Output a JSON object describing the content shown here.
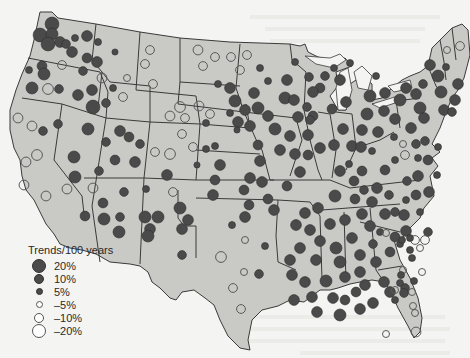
{
  "figure": {
    "type": "proportional-symbol map",
    "region": "Contiguous United States",
    "colors": {
      "page_background": "#f4f4f2",
      "land_fill": "#c9c9c6",
      "state_border": "#3a3a3a",
      "positive_fill": "#4a4a4a",
      "negative_stroke": "#5a5a5a"
    }
  },
  "legend": {
    "title": "Trends/100 years",
    "items": [
      {
        "label": "20%",
        "sign": "positive",
        "radius": 7
      },
      {
        "label": "10%",
        "sign": "positive",
        "radius": 5
      },
      {
        "label": "5%",
        "sign": "positive",
        "radius": 3.5
      },
      {
        "label": "–5%",
        "sign": "negative",
        "radius": 3.5
      },
      {
        "label": "–10%",
        "sign": "negative",
        "radius": 5
      },
      {
        "label": "–20%",
        "sign": "negative",
        "radius": 7
      }
    ]
  },
  "chart_data": {
    "type": "scatter",
    "title": "",
    "legend_title": "Trends/100 years",
    "legend_entries": [
      "20%",
      "10%",
      "5%",
      "–5%",
      "–10%",
      "–20%"
    ],
    "encoding": "filled dark circle = increasing trend; open circle = decreasing trend; circle area proportional to trend magnitude",
    "points": [
      {
        "x": 52,
        "y": 24,
        "v": 20
      },
      {
        "x": 40,
        "y": 35,
        "v": 20
      },
      {
        "x": 52,
        "y": 34,
        "v": 15
      },
      {
        "x": 48,
        "y": 44,
        "v": 20
      },
      {
        "x": 60,
        "y": 42,
        "v": 12
      },
      {
        "x": 66,
        "y": 44,
        "v": 8
      },
      {
        "x": 75,
        "y": 38,
        "v": 5
      },
      {
        "x": 87,
        "y": 36,
        "v": 12
      },
      {
        "x": 98,
        "y": 42,
        "v": 5
      },
      {
        "x": 72,
        "y": 52,
        "v": 12
      },
      {
        "x": 87,
        "y": 58,
        "v": 10
      },
      {
        "x": 97,
        "y": 62,
        "v": 12
      },
      {
        "x": 115,
        "y": 52,
        "v": 4
      },
      {
        "x": 150,
        "y": 50,
        "v": -8
      },
      {
        "x": 145,
        "y": 64,
        "v": -8
      },
      {
        "x": 127,
        "y": 78,
        "v": -5
      },
      {
        "x": 153,
        "y": 84,
        "v": -8
      },
      {
        "x": 42,
        "y": 66,
        "v": 10
      },
      {
        "x": 44,
        "y": 74,
        "v": 15
      },
      {
        "x": 29,
        "y": 70,
        "v": 5
      },
      {
        "x": 62,
        "y": 65,
        "v": -8
      },
      {
        "x": 83,
        "y": 71,
        "v": 8
      },
      {
        "x": 102,
        "y": 78,
        "v": -10
      },
      {
        "x": 32,
        "y": 88,
        "v": 15
      },
      {
        "x": 48,
        "y": 89,
        "v": -12
      },
      {
        "x": 59,
        "y": 89,
        "v": 8
      },
      {
        "x": 78,
        "y": 95,
        "v": 12
      },
      {
        "x": 92,
        "y": 90,
        "v": 12
      },
      {
        "x": 113,
        "y": 88,
        "v": 5
      },
      {
        "x": 106,
        "y": 103,
        "v": 8
      },
      {
        "x": 93,
        "y": 107,
        "v": 20
      },
      {
        "x": 123,
        "y": 97,
        "v": -8
      },
      {
        "x": 18,
        "y": 118,
        "v": -10
      },
      {
        "x": 32,
        "y": 126,
        "v": -10
      },
      {
        "x": 43,
        "y": 131,
        "v": 8
      },
      {
        "x": 58,
        "y": 124,
        "v": 8
      },
      {
        "x": 88,
        "y": 129,
        "v": 15
      },
      {
        "x": 120,
        "y": 131,
        "v": 12
      },
      {
        "x": 129,
        "y": 137,
        "v": 10
      },
      {
        "x": 140,
        "y": 144,
        "v": 8
      },
      {
        "x": 106,
        "y": 142,
        "v": 8
      },
      {
        "x": 115,
        "y": 160,
        "v": 10
      },
      {
        "x": 135,
        "y": 162,
        "v": 12
      },
      {
        "x": 74,
        "y": 157,
        "v": 15
      },
      {
        "x": 37,
        "y": 155,
        "v": -12
      },
      {
        "x": 26,
        "y": 162,
        "v": -10
      },
      {
        "x": 24,
        "y": 185,
        "v": -10
      },
      {
        "x": 75,
        "y": 177,
        "v": 15
      },
      {
        "x": 99,
        "y": 171,
        "v": 8
      },
      {
        "x": 67,
        "y": 189,
        "v": -10
      },
      {
        "x": 93,
        "y": 188,
        "v": -10
      },
      {
        "x": 46,
        "y": 196,
        "v": -10
      },
      {
        "x": 124,
        "y": 192,
        "v": 8
      },
      {
        "x": 103,
        "y": 203,
        "v": 10
      },
      {
        "x": 146,
        "y": 189,
        "v": 5
      },
      {
        "x": 85,
        "y": 216,
        "v": 10
      },
      {
        "x": 104,
        "y": 219,
        "v": 15
      },
      {
        "x": 120,
        "y": 217,
        "v": 8
      },
      {
        "x": 145,
        "y": 217,
        "v": 15
      },
      {
        "x": 158,
        "y": 217,
        "v": 15
      },
      {
        "x": 150,
        "y": 229,
        "v": 12
      },
      {
        "x": 119,
        "y": 232,
        "v": 15
      },
      {
        "x": 148,
        "y": 236,
        "v": 15
      },
      {
        "x": 182,
        "y": 229,
        "v": 12
      },
      {
        "x": 180,
        "y": 107,
        "v": -12
      },
      {
        "x": 170,
        "y": 116,
        "v": -10
      },
      {
        "x": 185,
        "y": 118,
        "v": -8
      },
      {
        "x": 199,
        "y": 106,
        "v": -10
      },
      {
        "x": 210,
        "y": 114,
        "v": -8
      },
      {
        "x": 182,
        "y": 134,
        "v": -8
      },
      {
        "x": 206,
        "y": 123,
        "v": 5
      },
      {
        "x": 170,
        "y": 154,
        "v": -12
      },
      {
        "x": 193,
        "y": 147,
        "v": -8
      },
      {
        "x": 155,
        "y": 152,
        "v": -8
      },
      {
        "x": 167,
        "y": 175,
        "v": 12
      },
      {
        "x": 206,
        "y": 149,
        "v": 5
      },
      {
        "x": 215,
        "y": 146,
        "v": 5
      },
      {
        "x": 197,
        "y": 165,
        "v": 4
      },
      {
        "x": 173,
        "y": 192,
        "v": -8
      },
      {
        "x": 215,
        "y": 180,
        "v": 10
      },
      {
        "x": 180,
        "y": 208,
        "v": 15
      },
      {
        "x": 188,
        "y": 220,
        "v": 12
      },
      {
        "x": 213,
        "y": 195,
        "v": 12
      },
      {
        "x": 220,
        "y": 165,
        "v": 12
      },
      {
        "x": 235,
        "y": 101,
        "v": 15
      },
      {
        "x": 230,
        "y": 88,
        "v": 12
      },
      {
        "x": 238,
        "y": 122,
        "v": 12
      },
      {
        "x": 245,
        "y": 110,
        "v": 12
      },
      {
        "x": 230,
        "y": 113,
        "v": 5
      },
      {
        "x": 250,
        "y": 126,
        "v": 12
      },
      {
        "x": 258,
        "y": 145,
        "v": 10
      },
      {
        "x": 260,
        "y": 161,
        "v": 12
      },
      {
        "x": 250,
        "y": 178,
        "v": 12
      },
      {
        "x": 262,
        "y": 182,
        "v": 12
      },
      {
        "x": 244,
        "y": 190,
        "v": 10
      },
      {
        "x": 249,
        "y": 205,
        "v": 10
      },
      {
        "x": 245,
        "y": 217,
        "v": 12
      },
      {
        "x": 268,
        "y": 199,
        "v": 10
      },
      {
        "x": 274,
        "y": 210,
        "v": 12
      },
      {
        "x": 287,
        "y": 186,
        "v": 10
      },
      {
        "x": 198,
        "y": 50,
        "v": -10
      },
      {
        "x": 215,
        "y": 57,
        "v": -8
      },
      {
        "x": 203,
        "y": 66,
        "v": -8
      },
      {
        "x": 218,
        "y": 84,
        "v": 5
      },
      {
        "x": 231,
        "y": 57,
        "v": -8
      },
      {
        "x": 247,
        "y": 55,
        "v": -8
      },
      {
        "x": 260,
        "y": 68,
        "v": 5
      },
      {
        "x": 240,
        "y": 70,
        "v": -8
      },
      {
        "x": 237,
        "y": 130,
        "v": 4
      },
      {
        "x": 258,
        "y": 108,
        "v": 15
      },
      {
        "x": 254,
        "y": 93,
        "v": 12
      },
      {
        "x": 268,
        "y": 81,
        "v": 5
      },
      {
        "x": 268,
        "y": 116,
        "v": 12
      },
      {
        "x": 285,
        "y": 98,
        "v": 15
      },
      {
        "x": 294,
        "y": 100,
        "v": 12
      },
      {
        "x": 298,
        "y": 117,
        "v": 12
      },
      {
        "x": 275,
        "y": 129,
        "v": 15
      },
      {
        "x": 290,
        "y": 136,
        "v": 12
      },
      {
        "x": 308,
        "y": 135,
        "v": 12
      },
      {
        "x": 313,
        "y": 116,
        "v": 10
      },
      {
        "x": 280,
        "y": 150,
        "v": 12
      },
      {
        "x": 295,
        "y": 154,
        "v": 12
      },
      {
        "x": 300,
        "y": 172,
        "v": 12
      },
      {
        "x": 308,
        "y": 155,
        "v": 10
      },
      {
        "x": 310,
        "y": 120,
        "v": 8
      },
      {
        "x": 320,
        "y": 88,
        "v": 10
      },
      {
        "x": 340,
        "y": 80,
        "v": 12
      },
      {
        "x": 346,
        "y": 102,
        "v": 12
      },
      {
        "x": 332,
        "y": 109,
        "v": 10
      },
      {
        "x": 350,
        "y": 63,
        "v": 5
      },
      {
        "x": 295,
        "y": 62,
        "v": 5
      },
      {
        "x": 309,
        "y": 77,
        "v": 8
      },
      {
        "x": 325,
        "y": 76,
        "v": 8
      },
      {
        "x": 334,
        "y": 68,
        "v": 5
      },
      {
        "x": 313,
        "y": 92,
        "v": 12
      },
      {
        "x": 287,
        "y": 80,
        "v": 12
      },
      {
        "x": 307,
        "y": 107,
        "v": 8
      },
      {
        "x": 343,
        "y": 129,
        "v": 12
      },
      {
        "x": 334,
        "y": 145,
        "v": 12
      },
      {
        "x": 320,
        "y": 148,
        "v": 12
      },
      {
        "x": 352,
        "y": 146,
        "v": 12
      },
      {
        "x": 361,
        "y": 147,
        "v": 12
      },
      {
        "x": 362,
        "y": 130,
        "v": 12
      },
      {
        "x": 378,
        "y": 132,
        "v": 12
      },
      {
        "x": 367,
        "y": 114,
        "v": 15
      },
      {
        "x": 384,
        "y": 111,
        "v": 12
      },
      {
        "x": 370,
        "y": 96,
        "v": 15
      },
      {
        "x": 385,
        "y": 93,
        "v": 12
      },
      {
        "x": 395,
        "y": 119,
        "v": 12
      },
      {
        "x": 394,
        "y": 137,
        "v": 5
      },
      {
        "x": 403,
        "y": 144,
        "v": -5
      },
      {
        "x": 411,
        "y": 128,
        "v": 12
      },
      {
        "x": 400,
        "y": 100,
        "v": 15
      },
      {
        "x": 406,
        "y": 88,
        "v": 12
      },
      {
        "x": 420,
        "y": 108,
        "v": 15
      },
      {
        "x": 416,
        "y": 94,
        "v": 12
      },
      {
        "x": 424,
        "y": 118,
        "v": 12
      },
      {
        "x": 441,
        "y": 92,
        "v": 15
      },
      {
        "x": 438,
        "y": 76,
        "v": 15
      },
      {
        "x": 430,
        "y": 65,
        "v": 12
      },
      {
        "x": 423,
        "y": 84,
        "v": 8
      },
      {
        "x": 444,
        "y": 110,
        "v": 12
      },
      {
        "x": 452,
        "y": 112,
        "v": 8
      },
      {
        "x": 458,
        "y": 84,
        "v": 12
      },
      {
        "x": 455,
        "y": 100,
        "v": 12
      },
      {
        "x": 460,
        "y": 46,
        "v": -8
      },
      {
        "x": 447,
        "y": 50,
        "v": -5
      },
      {
        "x": 446,
        "y": 67,
        "v": 5
      },
      {
        "x": 376,
        "y": 76,
        "v": 5
      },
      {
        "x": 405,
        "y": 155,
        "v": -8
      },
      {
        "x": 395,
        "y": 160,
        "v": 5
      },
      {
        "x": 385,
        "y": 170,
        "v": 10
      },
      {
        "x": 362,
        "y": 171,
        "v": 10
      },
      {
        "x": 340,
        "y": 171,
        "v": 12
      },
      {
        "x": 349,
        "y": 164,
        "v": 5
      },
      {
        "x": 372,
        "y": 151,
        "v": 5
      },
      {
        "x": 425,
        "y": 141,
        "v": 8
      },
      {
        "x": 416,
        "y": 144,
        "v": 8
      },
      {
        "x": 418,
        "y": 158,
        "v": 5
      },
      {
        "x": 428,
        "y": 160,
        "v": 10
      },
      {
        "x": 438,
        "y": 147,
        "v": 5
      },
      {
        "x": 418,
        "y": 176,
        "v": 12
      },
      {
        "x": 407,
        "y": 181,
        "v": 8
      },
      {
        "x": 437,
        "y": 175,
        "v": 5
      },
      {
        "x": 416,
        "y": 195,
        "v": 10
      },
      {
        "x": 429,
        "y": 192,
        "v": 12
      },
      {
        "x": 406,
        "y": 200,
        "v": 5
      },
      {
        "x": 389,
        "y": 195,
        "v": 8
      },
      {
        "x": 377,
        "y": 188,
        "v": 12
      },
      {
        "x": 364,
        "y": 190,
        "v": 8
      },
      {
        "x": 354,
        "y": 181,
        "v": 10
      },
      {
        "x": 385,
        "y": 214,
        "v": 12
      },
      {
        "x": 404,
        "y": 215,
        "v": 12
      },
      {
        "x": 395,
        "y": 212,
        "v": 8
      },
      {
        "x": 420,
        "y": 212,
        "v": 5
      },
      {
        "x": 428,
        "y": 232,
        "v": 8
      },
      {
        "x": 406,
        "y": 231,
        "v": 12
      },
      {
        "x": 395,
        "y": 237,
        "v": 10
      },
      {
        "x": 380,
        "y": 232,
        "v": 5
      },
      {
        "x": 370,
        "y": 226,
        "v": 12
      },
      {
        "x": 362,
        "y": 214,
        "v": 12
      },
      {
        "x": 372,
        "y": 202,
        "v": 12
      },
      {
        "x": 355,
        "y": 199,
        "v": 10
      },
      {
        "x": 335,
        "y": 196,
        "v": 15
      },
      {
        "x": 330,
        "y": 224,
        "v": 12
      },
      {
        "x": 345,
        "y": 220,
        "v": 12
      },
      {
        "x": 318,
        "y": 208,
        "v": 12
      },
      {
        "x": 305,
        "y": 213,
        "v": 12
      },
      {
        "x": 296,
        "y": 225,
        "v": 12
      },
      {
        "x": 310,
        "y": 230,
        "v": 12
      },
      {
        "x": 320,
        "y": 241,
        "v": 12
      },
      {
        "x": 336,
        "y": 248,
        "v": 15
      },
      {
        "x": 352,
        "y": 238,
        "v": 12
      },
      {
        "x": 360,
        "y": 255,
        "v": 12
      },
      {
        "x": 340,
        "y": 262,
        "v": 15
      },
      {
        "x": 316,
        "y": 260,
        "v": 12
      },
      {
        "x": 300,
        "y": 248,
        "v": 12
      },
      {
        "x": 290,
        "y": 260,
        "v": 12
      },
      {
        "x": 292,
        "y": 275,
        "v": 12
      },
      {
        "x": 305,
        "y": 282,
        "v": 12
      },
      {
        "x": 326,
        "y": 281,
        "v": 15
      },
      {
        "x": 345,
        "y": 277,
        "v": 12
      },
      {
        "x": 360,
        "y": 272,
        "v": 12
      },
      {
        "x": 376,
        "y": 262,
        "v": 12
      },
      {
        "x": 390,
        "y": 252,
        "v": 10
      },
      {
        "x": 410,
        "y": 250,
        "v": 5
      },
      {
        "x": 425,
        "y": 240,
        "v": -8
      },
      {
        "x": 386,
        "y": 233,
        "v": -5
      },
      {
        "x": 365,
        "y": 285,
        "v": 12
      },
      {
        "x": 384,
        "y": 282,
        "v": 12
      },
      {
        "x": 312,
        "y": 297,
        "v": 12
      },
      {
        "x": 333,
        "y": 298,
        "v": 12
      },
      {
        "x": 345,
        "y": 300,
        "v": 10
      },
      {
        "x": 356,
        "y": 292,
        "v": 10
      },
      {
        "x": 317,
        "y": 312,
        "v": 12
      },
      {
        "x": 340,
        "y": 315,
        "v": 15
      },
      {
        "x": 360,
        "y": 309,
        "v": 12
      },
      {
        "x": 373,
        "y": 303,
        "v": 12
      },
      {
        "x": 390,
        "y": 292,
        "v": 12
      },
      {
        "x": 405,
        "y": 288,
        "v": 8
      },
      {
        "x": 294,
        "y": 300,
        "v": 12
      },
      {
        "x": 386,
        "y": 334,
        "v": -5
      },
      {
        "x": 415,
        "y": 240,
        "v": -8
      },
      {
        "x": 420,
        "y": 248,
        "v": -5
      },
      {
        "x": 410,
        "y": 238,
        "v": 5
      },
      {
        "x": 400,
        "y": 244,
        "v": 5
      },
      {
        "x": 373,
        "y": 244,
        "v": 8
      },
      {
        "x": 412,
        "y": 258,
        "v": 5
      },
      {
        "x": 422,
        "y": 272,
        "v": -5
      },
      {
        "x": 402,
        "y": 240,
        "v": 5
      },
      {
        "x": 403,
        "y": 270,
        "v": -5
      },
      {
        "x": 400,
        "y": 283,
        "v": 5
      },
      {
        "x": 395,
        "y": 300,
        "v": 5
      },
      {
        "x": 412,
        "y": 292,
        "v": -5
      },
      {
        "x": 414,
        "y": 281,
        "v": 5
      },
      {
        "x": 401,
        "y": 275,
        "v": 5
      },
      {
        "x": 232,
        "y": 225,
        "v": 5
      },
      {
        "x": 245,
        "y": 240,
        "v": -5
      },
      {
        "x": 265,
        "y": 246,
        "v": 5
      },
      {
        "x": 221,
        "y": 257,
        "v": -12
      },
      {
        "x": 182,
        "y": 255,
        "v": 8
      },
      {
        "x": 244,
        "y": 272,
        "v": -5
      },
      {
        "x": 259,
        "y": 274,
        "v": 8
      },
      {
        "x": 233,
        "y": 288,
        "v": -8
      },
      {
        "x": 241,
        "y": 309,
        "v": -8
      },
      {
        "x": 395,
        "y": 290,
        "v": -5
      },
      {
        "x": 404,
        "y": 293,
        "v": 8
      },
      {
        "x": 413,
        "y": 306,
        "v": -5
      },
      {
        "x": 415,
        "y": 313,
        "v": -5
      },
      {
        "x": 416,
        "y": 332,
        "v": -10
      }
    ]
  }
}
